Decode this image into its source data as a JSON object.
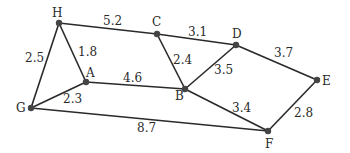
{
  "graph": {
    "nodes": [
      {
        "id": "H",
        "x": 59,
        "y": 23,
        "lx": 52,
        "ly": 17
      },
      {
        "id": "C",
        "x": 157,
        "y": 34,
        "lx": 152,
        "ly": 26
      },
      {
        "id": "D",
        "x": 236,
        "y": 45,
        "lx": 232,
        "ly": 38
      },
      {
        "id": "E",
        "x": 317,
        "y": 80,
        "lx": 322,
        "ly": 85
      },
      {
        "id": "A",
        "x": 86,
        "y": 82,
        "lx": 86,
        "ly": 77
      },
      {
        "id": "B",
        "x": 185,
        "y": 89,
        "lx": 175,
        "ly": 100
      },
      {
        "id": "G",
        "x": 31,
        "y": 108,
        "lx": 16,
        "ly": 112
      },
      {
        "id": "F",
        "x": 268,
        "y": 131,
        "lx": 265,
        "ly": 148
      }
    ],
    "edges": [
      {
        "from": "H",
        "to": "C",
        "weight": "5.2",
        "lx": 103,
        "ly": 25
      },
      {
        "from": "C",
        "to": "D",
        "weight": "3.1",
        "lx": 188,
        "ly": 36
      },
      {
        "from": "D",
        "to": "E",
        "weight": "3.7",
        "lx": 274,
        "ly": 57
      },
      {
        "from": "H",
        "to": "A",
        "weight": "1.8",
        "lx": 78,
        "ly": 56
      },
      {
        "from": "H",
        "to": "G",
        "weight": "2.5",
        "lx": 25,
        "ly": 62
      },
      {
        "from": "C",
        "to": "B",
        "weight": "2.4",
        "lx": 173,
        "ly": 64
      },
      {
        "from": "D",
        "to": "B",
        "weight": "3.5",
        "lx": 214,
        "ly": 74
      },
      {
        "from": "A",
        "to": "B",
        "weight": "4.6",
        "lx": 123,
        "ly": 82
      },
      {
        "from": "A",
        "to": "G",
        "weight": "2.3",
        "lx": 63,
        "ly": 103
      },
      {
        "from": "B",
        "to": "F",
        "weight": "3.4",
        "lx": 232,
        "ly": 112
      },
      {
        "from": "E",
        "to": "F",
        "weight": "2.8",
        "lx": 294,
        "ly": 117
      },
      {
        "from": "G",
        "to": "F",
        "weight": "8.7",
        "lx": 137,
        "ly": 132
      }
    ]
  }
}
